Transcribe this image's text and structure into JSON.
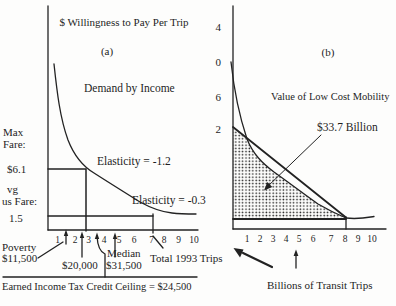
{
  "background": "#fdfdfc",
  "ink": "#222222",
  "panel_a": {
    "title": "$ Willingness to Pay Per Trip",
    "panel_label": "(a)",
    "curve_label": "Demand by Income",
    "elasticity_upper_label": "Elasticity = -1.2",
    "elasticity_lower_label": "Elasticity = -0.3",
    "max_fare_word1": "Max",
    "max_fare_word2": "Fare:",
    "max_fare_value": "$6.1",
    "avg_fare_word1": "vg",
    "avg_fare_word2": "us Fare:",
    "avg_fare_value": "1.5",
    "x_ticks": [
      "1",
      "2",
      "3",
      "4",
      "5",
      "6",
      "7",
      "8",
      "9",
      "10"
    ],
    "poverty_word": "Poverty",
    "poverty_value": "$11,500",
    "income_20k_value": "$20,000",
    "median_word": "Median",
    "median_value": "$31,500",
    "total_trips_label": "Total 1993 Trips",
    "eitc_note": "Earned Income Tax Credit Ceiling = $24,500"
  },
  "panel_b": {
    "panel_label": "(b)",
    "title": "Value of Low Cost Mobility",
    "area_value_label": "$33.7 Billion",
    "y_ticks": [
      "4",
      "0",
      "6",
      "2"
    ],
    "x_ticks": [
      "1",
      "2",
      "3",
      "4",
      "5",
      "6",
      "7",
      "8",
      "9",
      "10"
    ],
    "x_axis_title": "Billions of Transit Trips"
  },
  "chart_data": [
    {
      "panel": "a",
      "type": "line",
      "title": "$ Willingness to Pay Per Trip",
      "series": [
        {
          "name": "Demand by Income",
          "x": [
            0.5,
            1,
            2,
            3,
            4,
            5,
            6,
            7,
            8,
            9,
            10
          ],
          "y": [
            16,
            12.5,
            8.3,
            6.1,
            4.4,
            3.3,
            2.5,
            1.9,
            1.6,
            1.5,
            1.4
          ]
        }
      ],
      "ylabel": "$ Willingness to Pay Per Trip",
      "xlabel": "Total 1993 Trips",
      "x_ticks": [
        1,
        2,
        3,
        4,
        5,
        6,
        7,
        8,
        9,
        10
      ],
      "reference_lines": [
        {
          "label": "Max Fare: $6.1",
          "y": 6.1,
          "vertical_drop_at_x": 2.8
        },
        {
          "label": "Avg Bus Fare: 1.5",
          "y": 1.5,
          "vertical_drop_at_x": 7
        }
      ],
      "point_annotations": [
        {
          "label": "Poverty $11,500",
          "x": 1.6
        },
        {
          "label": "$20,000",
          "x": 2.7
        },
        {
          "label": "Earned Income Tax Credit Ceiling = $24,500",
          "x": 3.6
        },
        {
          "label": "Median $31,500",
          "x": 4.8
        },
        {
          "label": "Total 1993 Trips",
          "x": 7
        }
      ],
      "curve_annotations": [
        "Elasticity = -1.2",
        "Elasticity = -0.3"
      ]
    },
    {
      "panel": "b",
      "type": "area",
      "title": "Value of Low Cost Mobility",
      "area_label": "$33.7 Billion",
      "y_ticks_visible": [
        "4",
        "0",
        "6",
        "2"
      ],
      "x_ticks": [
        1,
        2,
        3,
        4,
        5,
        6,
        7,
        8,
        9,
        10
      ],
      "xlabel": "Billions of Transit Trips",
      "shaded_region": {
        "description": "Stippled area under the demand curve above the fare floor line, from 0 to 8 billion transit trips",
        "x_end": 8,
        "value": "$33.7 Billion"
      },
      "chord_line": {
        "from_y_tick": "2",
        "to_x": 8
      }
    }
  ]
}
